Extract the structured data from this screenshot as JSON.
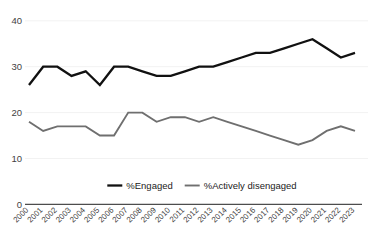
{
  "chart_data": {
    "type": "line",
    "title": "",
    "subtitle": "",
    "xlabel": "",
    "ylabel": "",
    "ylim": [
      0,
      40
    ],
    "yticks": [
      0,
      10,
      20,
      30,
      40
    ],
    "ytick_labels": [
      "0",
      "10",
      "20",
      "30",
      "40"
    ],
    "grid": true,
    "grid_axis": "y",
    "legend_position": "bottom",
    "categories": [
      "2000",
      "2001",
      "2002",
      "2003",
      "2004",
      "2005",
      "2006",
      "2007",
      "2008",
      "2009",
      "2010",
      "2011",
      "2012",
      "2013",
      "2014",
      "2015",
      "2016",
      "2017",
      "2018",
      "2019",
      "2020",
      "2021",
      "2022",
      "2023"
    ],
    "series": [
      {
        "name": "%Engaged",
        "color": "#111111",
        "values": [
          26,
          30,
          30,
          28,
          29,
          26,
          30,
          30,
          29,
          28,
          28,
          29,
          30,
          30,
          31,
          32,
          33,
          33,
          34,
          35,
          36,
          34,
          32,
          33
        ]
      },
      {
        "name": "%Actively disengaged",
        "color": "#6f6f6f",
        "values": [
          18,
          16,
          17,
          17,
          17,
          15,
          15,
          20,
          20,
          18,
          19,
          19,
          18,
          19,
          18,
          17,
          16,
          15,
          14,
          13,
          14,
          16,
          17,
          16
        ]
      }
    ]
  },
  "legend": {
    "items": [
      {
        "label": "%Engaged",
        "color": "#111111"
      },
      {
        "label": "%Actively disengaged",
        "color": "#6f6f6f"
      }
    ]
  },
  "colors": {
    "engaged": "#111111",
    "disengaged": "#6f6f6f",
    "grid": "#f2f2f2",
    "axis": "#4d4d4d",
    "background": "#ffffff",
    "tick_text": "#3f3f3f"
  }
}
